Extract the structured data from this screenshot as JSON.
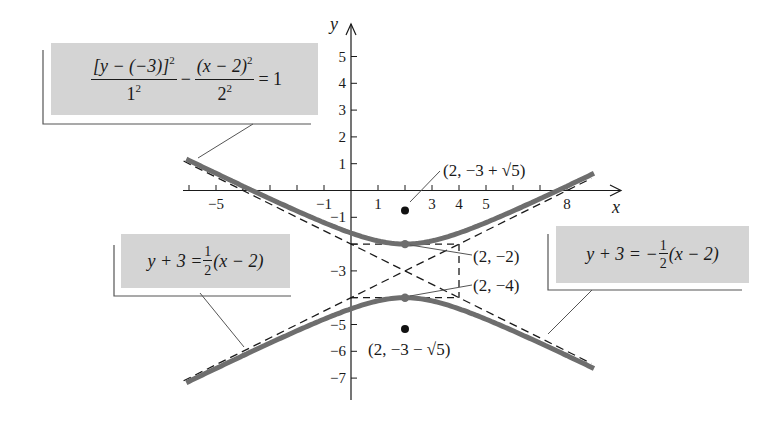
{
  "diagram": {
    "type": "hyperbola-graph",
    "axes": {
      "x_label": "x",
      "y_label": "y",
      "x_ticks": [
        {
          "value": -5,
          "label": "−5"
        },
        {
          "value": -1,
          "label": "−1"
        },
        {
          "value": 1,
          "label": "1"
        },
        {
          "value": 3,
          "label": "3"
        },
        {
          "value": 4,
          "label": "4"
        },
        {
          "value": 5,
          "label": "5"
        },
        {
          "value": 8,
          "label": "8"
        }
      ],
      "x_tick_positions": [
        -6,
        -5,
        -4,
        -3,
        -2,
        -1,
        1,
        2,
        3,
        4,
        5,
        6,
        7,
        8
      ],
      "y_ticks": [
        {
          "value": 5,
          "label": "5"
        },
        {
          "value": 4,
          "label": "4"
        },
        {
          "value": 3,
          "label": "3"
        },
        {
          "value": 2,
          "label": "2"
        },
        {
          "value": 1,
          "label": "1"
        },
        {
          "value": -1,
          "label": "−1"
        },
        {
          "value": -3,
          "label": "−3"
        },
        {
          "value": -5,
          "label": "−5"
        },
        {
          "value": -6,
          "label": "−6"
        },
        {
          "value": -7,
          "label": "−7"
        }
      ],
      "y_tick_positions": [
        5,
        4,
        3,
        2,
        1,
        -1,
        -2,
        -3,
        -4,
        -5,
        -6,
        -7
      ]
    },
    "equations": {
      "hyperbola": {
        "num1": "[y − (−3)]",
        "num1_exp": "2",
        "den1": "1",
        "den1_exp": "2",
        "minus": "−",
        "num2": "(x − 2)",
        "num2_exp": "2",
        "den2": "2",
        "den2_exp": "2",
        "rhs": "= 1"
      },
      "asymptote_pos": {
        "lhs": "y + 3 =",
        "frac_num": "1",
        "frac_den": "2",
        "rhs": "(x − 2)"
      },
      "asymptote_neg": {
        "lhs": "y + 3 = −",
        "frac_num": "1",
        "frac_den": "2",
        "rhs": "(x − 2)"
      }
    },
    "points": {
      "focus_upper": "(2, −3 + √5)",
      "vertex_upper": "(2, −2)",
      "vertex_lower": "(2, −4)",
      "focus_lower": "(2, −3 − √5)"
    },
    "colors": {
      "curve": "#6e6e6e",
      "label_box": "#d4d4d4",
      "axis": "#1a1a1a"
    }
  }
}
